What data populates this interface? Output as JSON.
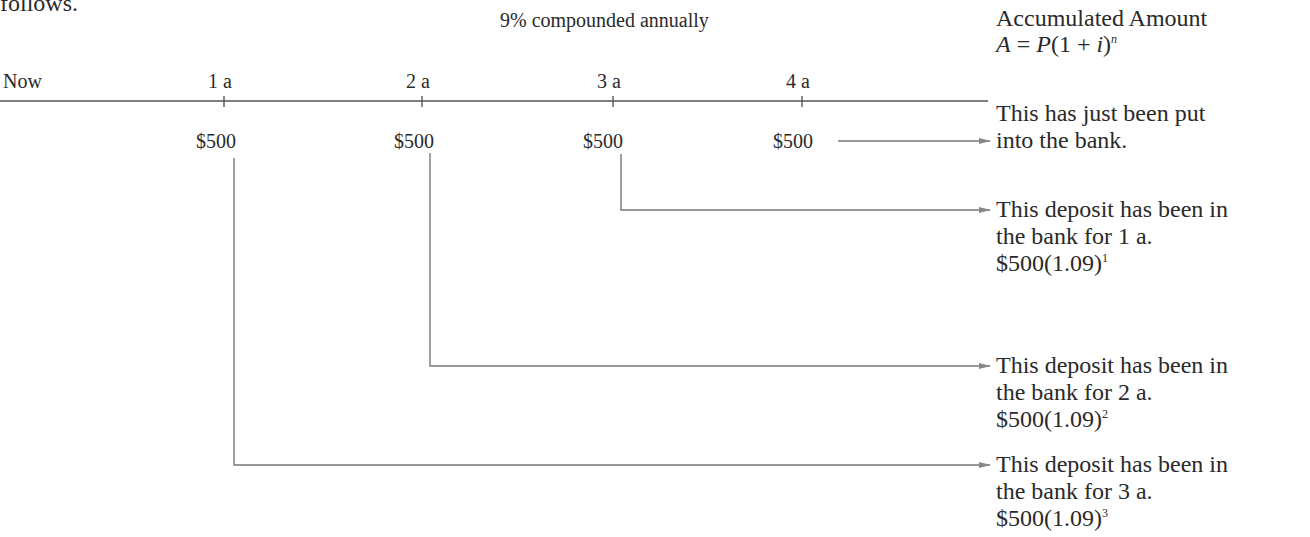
{
  "intro_text": "follows.",
  "rate_label": "9% compounded annually",
  "header": {
    "title": "Accumulated Amount",
    "formula": {
      "lhs": "A",
      "eq": " = ",
      "p": "P",
      "paren": "(1 + ",
      "i": "i",
      "close": ")",
      "exp": "n"
    }
  },
  "timeline": {
    "start_label": "Now",
    "ticks": [
      "1 a",
      "2 a",
      "3 a",
      "4 a"
    ],
    "deposits": [
      "$500",
      "$500",
      "$500",
      "$500"
    ]
  },
  "annotations": [
    {
      "lines": [
        "This has just been put",
        "into the bank."
      ]
    },
    {
      "lines": [
        "This deposit has been in",
        "the bank for 1 a."
      ],
      "formula": "$500(1.09)",
      "exp": "1"
    },
    {
      "lines": [
        "This deposit has been in",
        "the bank for 2 a."
      ],
      "formula": "$500(1.09)",
      "exp": "2"
    },
    {
      "lines": [
        "This deposit has been in",
        "the bank for 3 a."
      ],
      "formula": "$500(1.09)",
      "exp": "3"
    }
  ],
  "colors": {
    "text": "#2a2a2a",
    "line": "#555555",
    "connector": "#777777"
  }
}
